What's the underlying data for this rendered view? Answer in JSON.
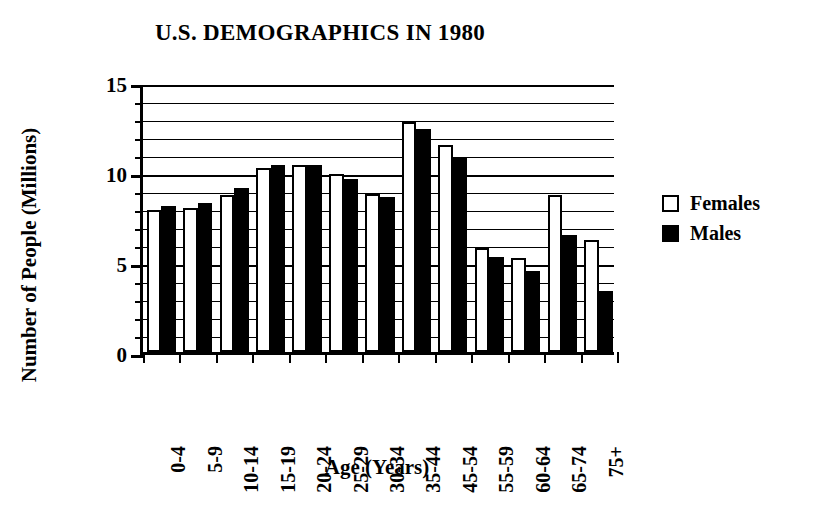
{
  "chart_data": {
    "type": "bar",
    "title": "U.S. DEMOGRAPHICS IN 1980",
    "xlabel": "Age (Years)",
    "ylabel": "Number of People (Millions)",
    "categories": [
      "0-4",
      "5-9",
      "10-14",
      "15-19",
      "20-24",
      "25-29",
      "30-34",
      "35-44",
      "45-54",
      "55-59",
      "60-64",
      "65-74",
      "75+"
    ],
    "series": [
      {
        "name": "Females",
        "color": "#ffffff",
        "values": [
          7.9,
          8.0,
          8.7,
          10.2,
          10.4,
          9.9,
          8.8,
          12.8,
          11.5,
          5.8,
          5.2,
          8.7,
          6.2
        ]
      },
      {
        "name": "Males",
        "color": "#000000",
        "values": [
          8.1,
          8.3,
          9.1,
          10.4,
          10.4,
          9.6,
          8.6,
          12.4,
          10.8,
          5.3,
          4.5,
          6.5,
          3.4
        ]
      }
    ],
    "ylim": [
      0,
      15
    ],
    "ytick_labels": [
      "0",
      "5",
      "10",
      "15"
    ],
    "ytick_values": [
      0,
      5,
      10,
      15
    ],
    "yminor_step": 1,
    "grid": true,
    "grid_axis": "y",
    "legend_position": "right",
    "legend": [
      {
        "label": "Females",
        "swatch": "white"
      },
      {
        "label": "Males",
        "swatch": "black"
      }
    ]
  }
}
